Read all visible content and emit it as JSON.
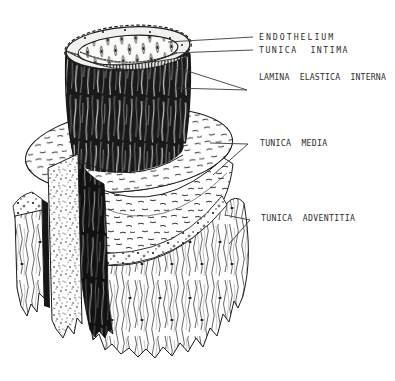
{
  "figure": {
    "type": "anatomical-cutaway-illustration",
    "colors": {
      "background": "#ffffff",
      "ink": "#1c1c1c"
    },
    "labels": {
      "endothelium": "ENDOTHELIUM",
      "tunica_intima": "TUNICA  INTIMA",
      "lamina_elastica_interna": "LAMINA  ELASTICA  INTERNA",
      "tunica_media": "TUNICA  MEDIA",
      "tunica_adventitia": "TUNICA  ADVENTITIA"
    }
  }
}
